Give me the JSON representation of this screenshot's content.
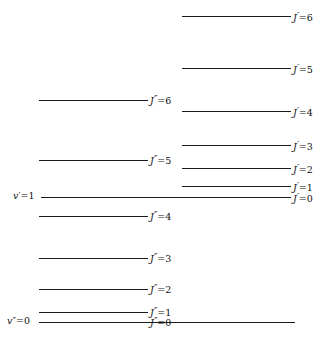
{
  "diagram": {
    "type": "energy-level-diagram",
    "width": 334,
    "height": 341,
    "line_color": "#1a1a1a",
    "text_color": "#111111",
    "background": "#ffffff"
  },
  "vibrational_states": [
    {
      "id": "v-upper",
      "symbol": "v",
      "primes": "′",
      "equals": "=",
      "value": "1",
      "label": "v′=1",
      "label_x": 13,
      "label_y": 191,
      "line_y": 197,
      "line_x1": 41,
      "line_x2": 290
    },
    {
      "id": "v-lower",
      "symbol": "v",
      "primes": "″",
      "equals": "=",
      "value": "0",
      "label": "v″=0",
      "label_x": 7,
      "label_y": 316,
      "line_y": 322,
      "line_x1": 39,
      "line_x2": 295
    }
  ],
  "upper_rotational_levels": [
    {
      "symbol": "J",
      "primes": "′",
      "equals": "=",
      "value": "6",
      "label": "J′=6",
      "line_y": 16,
      "line_x1": 182,
      "line_x2": 291,
      "label_x": 293,
      "label_y": 11
    },
    {
      "symbol": "J",
      "primes": "′",
      "equals": "=",
      "value": "5",
      "label": "J′=5",
      "line_y": 68,
      "line_x1": 182,
      "line_x2": 291,
      "label_x": 293,
      "label_y": 63
    },
    {
      "symbol": "J",
      "primes": "′",
      "equals": "=",
      "value": "4",
      "label": "J′=4",
      "line_y": 111,
      "line_x1": 182,
      "line_x2": 291,
      "label_x": 293,
      "label_y": 106
    },
    {
      "symbol": "J",
      "primes": "′",
      "equals": "=",
      "value": "3",
      "label": "J′=3",
      "line_y": 145,
      "line_x1": 182,
      "line_x2": 291,
      "label_x": 293,
      "label_y": 140
    },
    {
      "symbol": "J",
      "primes": "′",
      "equals": "=",
      "value": "2",
      "label": "J′=2",
      "line_y": 168,
      "line_x1": 182,
      "line_x2": 291,
      "label_x": 293,
      "label_y": 163
    },
    {
      "symbol": "J",
      "primes": "′",
      "equals": "=",
      "value": "1",
      "label": "J′=1",
      "line_y": 186,
      "line_x1": 182,
      "line_x2": 291,
      "label_x": 293,
      "label_y": 181
    },
    {
      "symbol": "J",
      "primes": "′",
      "equals": "=",
      "value": "0",
      "label": "J′=0",
      "line_y": 197,
      "line_x1": 182,
      "line_x2": 291,
      "label_x": 293,
      "label_y": 192
    }
  ],
  "lower_rotational_levels": [
    {
      "symbol": "J",
      "primes": "″",
      "equals": "=",
      "value": "6",
      "label": "J″=6",
      "line_y": 100,
      "line_x1": 39,
      "line_x2": 148,
      "label_x": 150,
      "label_y": 94
    },
    {
      "symbol": "J",
      "primes": "″",
      "equals": "=",
      "value": "5",
      "label": "J″=5",
      "line_y": 160,
      "line_x1": 39,
      "line_x2": 148,
      "label_x": 150,
      "label_y": 154
    },
    {
      "symbol": "J",
      "primes": "″",
      "equals": "=",
      "value": "4",
      "label": "J″=4",
      "line_y": 216,
      "line_x1": 39,
      "line_x2": 148,
      "label_x": 150,
      "label_y": 210
    },
    {
      "symbol": "J",
      "primes": "″",
      "equals": "=",
      "value": "3",
      "label": "J″=3",
      "line_y": 258,
      "line_x1": 39,
      "line_x2": 148,
      "label_x": 150,
      "label_y": 252
    },
    {
      "symbol": "J",
      "primes": "″",
      "equals": "=",
      "value": "2",
      "label": "J″=2",
      "line_y": 289,
      "line_x1": 39,
      "line_x2": 148,
      "label_x": 150,
      "label_y": 283
    },
    {
      "symbol": "J",
      "primes": "″",
      "equals": "=",
      "value": "1",
      "label": "J″=1",
      "line_y": 312,
      "line_x1": 39,
      "line_x2": 148,
      "label_x": 150,
      "label_y": 306
    },
    {
      "symbol": "J",
      "primes": "″",
      "equals": "=",
      "value": "0",
      "label": "J″=0",
      "line_y": 322,
      "line_x1": 39,
      "line_x2": 148,
      "label_x": 150,
      "label_y": 316
    }
  ]
}
